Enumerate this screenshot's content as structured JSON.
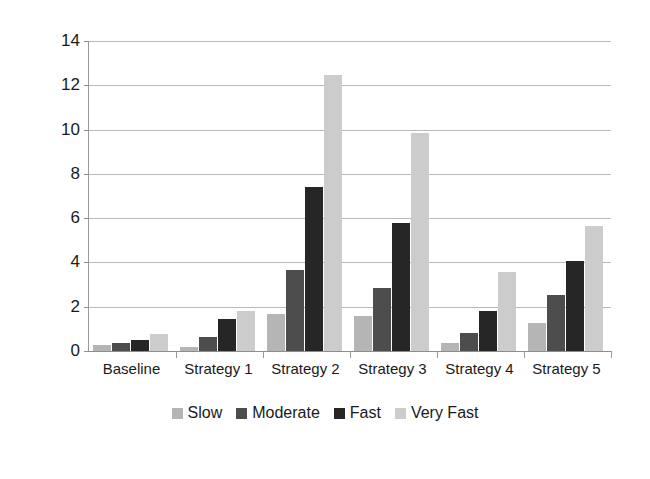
{
  "chart_data": {
    "type": "bar",
    "title": "",
    "subtitle": "",
    "xlabel": "",
    "ylabel": "Millions of Euros",
    "ylim": [
      0,
      14
    ],
    "ytick_step": 2,
    "yticks": [
      0,
      2,
      4,
      6,
      8,
      10,
      12,
      14
    ],
    "ytick_labels": [
      "0",
      "2",
      "4",
      "6",
      "8",
      "10",
      "12",
      "14"
    ],
    "grid": true,
    "legend_position": "bottom",
    "categories": [
      "Baseline",
      "Strategy 1",
      "Strategy 2",
      "Strategy 3",
      "Strategy 4",
      "Strategy 5"
    ],
    "series": [
      {
        "name": "Slow",
        "color": "#b5b5b5",
        "values": [
          0.25,
          0.2,
          1.65,
          1.6,
          0.35,
          1.25
        ]
      },
      {
        "name": "Moderate",
        "color": "#4d4d4d",
        "values": [
          0.35,
          0.65,
          3.65,
          2.85,
          0.8,
          2.55
        ]
      },
      {
        "name": "Fast",
        "color": "#262626",
        "values": [
          0.5,
          1.45,
          7.4,
          5.8,
          1.8,
          4.05
        ]
      },
      {
        "name": "Very Fast",
        "color": "#cccccc",
        "values": [
          0.75,
          1.8,
          12.45,
          9.85,
          3.55,
          5.65
        ]
      }
    ]
  },
  "axes": {
    "y_title": "Millions of Euros"
  },
  "legend": {
    "items": [
      {
        "label": "Slow",
        "color": "#b5b5b5"
      },
      {
        "label": "Moderate",
        "color": "#4d4d4d"
      },
      {
        "label": "Fast",
        "color": "#262626"
      },
      {
        "label": "Very Fast",
        "color": "#cccccc"
      }
    ]
  }
}
